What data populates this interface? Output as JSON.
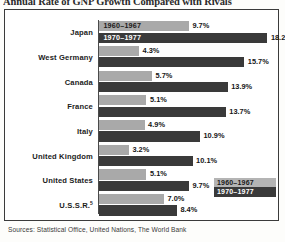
{
  "title": "Annual Rate of GNP Growth Compared with Rivals",
  "source_note": "Sources: Statistical Office, United Nations, The World Bank",
  "legend": {
    "position": "inside-bottom-right",
    "items": [
      {
        "label": "1960–1967",
        "color": "#a9a9a9",
        "key": "early"
      },
      {
        "label": "1970–1977",
        "color": "#3a3a3a",
        "key": "late"
      }
    ]
  },
  "colors": {
    "series_early": "#a9a9a9",
    "series_late": "#3a3a3a",
    "frame": "#3b3b3b",
    "axis": "#4a4a4a",
    "background": "#ffffff",
    "text": "#1c1c1c"
  },
  "inline_captions": {
    "early": "1960–1967",
    "late": "1970–1977"
  },
  "chart_data": {
    "type": "bar",
    "orientation": "horizontal",
    "title": "Annual Rate of GNP Growth Compared with Rivals",
    "xlabel": "",
    "ylabel": "",
    "xlim": [
      0,
      18.2
    ],
    "grid": false,
    "legend_position": "inside-bottom-right",
    "unit": "%",
    "categories": [
      "Japan",
      "West Germany",
      "Canada",
      "France",
      "Italy",
      "United Kingdom",
      "United States",
      "U.S.S.R."
    ],
    "category_notes": {
      "U.S.S.R.": "superscript 5"
    },
    "series": [
      {
        "name": "1960–1967",
        "key": "early",
        "color": "#a9a9a9",
        "values": [
          9.7,
          4.3,
          5.7,
          5.1,
          4.9,
          3.2,
          5.1,
          7.0
        ],
        "labels": [
          "9.7%",
          "4.3%",
          "5.7%",
          "5.1%",
          "4.9%",
          "3.2%",
          "5.1%",
          "7.0%"
        ]
      },
      {
        "name": "1970–1977",
        "key": "late",
        "color": "#3a3a3a",
        "values": [
          18.2,
          15.7,
          13.9,
          13.7,
          10.9,
          10.1,
          9.7,
          8.4
        ],
        "labels": [
          "18.2%",
          "15.7%",
          "13.9%",
          "13.7%",
          "10.9%",
          "10.1%",
          "9.7%",
          "8.4%"
        ]
      }
    ]
  }
}
